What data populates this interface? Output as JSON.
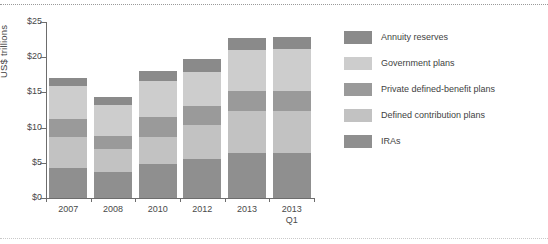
{
  "chart_data": {
    "type": "bar",
    "stacked": true,
    "title": "",
    "subtitle": "",
    "xlabel": "",
    "ylabel": "US$ trillions",
    "ylim": [
      0,
      25
    ],
    "ytick_values": [
      0,
      5,
      10,
      15,
      20,
      25
    ],
    "ytick_labels": [
      "$0",
      "$5",
      "$10",
      "$15",
      "$20",
      "$25"
    ],
    "grid": false,
    "legend_position": "right",
    "categories": [
      "2007",
      "2008",
      "2010",
      "2012",
      "2013",
      "2013\nQ1"
    ],
    "series": [
      {
        "name": "IRAs",
        "color": "#8f8f8f",
        "values": [
          4.2,
          3.7,
          4.9,
          5.5,
          6.4,
          6.4
        ]
      },
      {
        "name": "Defined contribution plans",
        "color": "#c2c2c2",
        "values": [
          4.4,
          3.2,
          3.8,
          4.9,
          6.0,
          6.0
        ]
      },
      {
        "name": "Private defined-benefit plans",
        "color": "#9a9a9a",
        "values": [
          2.6,
          1.9,
          2.8,
          2.7,
          2.8,
          2.8
        ]
      },
      {
        "name": "Government plans",
        "color": "#cdcdcd",
        "values": [
          4.7,
          4.4,
          5.1,
          4.8,
          5.8,
          6.0
        ]
      },
      {
        "name": "Annuity reserves",
        "color": "#8a8a8a",
        "values": [
          1.1,
          1.1,
          1.5,
          1.9,
          1.7,
          1.7
        ]
      }
    ],
    "totals": [
      17.0,
      14.3,
      18.1,
      19.8,
      22.7,
      22.9
    ]
  },
  "legend": {
    "items": [
      {
        "label": "Annuity reserves",
        "color": "#8a8a8a"
      },
      {
        "label": "Government plans",
        "color": "#cdcdcd"
      },
      {
        "label": "Private defined-benefit plans",
        "color": "#9a9a9a"
      },
      {
        "label": "Defined contribution plans",
        "color": "#c2c2c2"
      },
      {
        "label": "IRAs",
        "color": "#8f8f8f"
      }
    ]
  }
}
